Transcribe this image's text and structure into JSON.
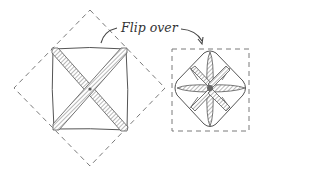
{
  "diagram": {
    "label": "Flip over",
    "colors": {
      "line": "#555555",
      "dash": "#7a7a7a",
      "hatch": "#8a8a8a",
      "background": "#ffffff"
    },
    "figures": [
      {
        "name": "before-flip",
        "description": "square folded along both diagonals inside dashed diamond outline"
      },
      {
        "name": "after-flip",
        "description": "rounded diamond with eight-spoke crease star inside dashed square outline"
      }
    ]
  }
}
